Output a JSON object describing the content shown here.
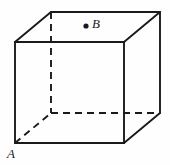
{
  "figure": {
    "type": "geometric-solid-diagram",
    "solid": "cube",
    "background_color": "#fefefe",
    "stroke_color": "#1a1a1a",
    "canvas": {
      "width": 170,
      "height": 165
    }
  },
  "labels": {
    "a": "A",
    "b": "B"
  },
  "points": {
    "b_dot": {
      "name": "point-B-marker",
      "x": 86,
      "y": 26,
      "radius": 2.6,
      "fill": "#1a1a1a"
    }
  },
  "geometry": {
    "front_face": {
      "name": "front-face",
      "top_left": [
        15,
        42
      ],
      "top_right": [
        124,
        42
      ],
      "bottom_right": [
        124,
        143
      ],
      "bottom_left": [
        15,
        143
      ]
    },
    "back_face": {
      "name": "back-face",
      "top_left": [
        51,
        12
      ],
      "top_right": [
        160,
        12
      ],
      "bottom_right": [
        160,
        113
      ],
      "bottom_left": [
        51,
        113
      ]
    },
    "solid_edges": [
      {
        "name": "front-top-edge",
        "from": [
          15,
          42
        ],
        "to": [
          124,
          42
        ]
      },
      {
        "name": "front-left-edge",
        "from": [
          15,
          42
        ],
        "to": [
          15,
          143
        ]
      },
      {
        "name": "front-bottom-edge",
        "from": [
          15,
          143
        ],
        "to": [
          124,
          143
        ]
      },
      {
        "name": "front-right-edge",
        "from": [
          124,
          42
        ],
        "to": [
          124,
          143
        ]
      },
      {
        "name": "back-top-edge",
        "from": [
          51,
          12
        ],
        "to": [
          160,
          12
        ]
      },
      {
        "name": "back-right-edge",
        "from": [
          160,
          12
        ],
        "to": [
          160,
          113
        ]
      },
      {
        "name": "top-left-diagonal-edge",
        "from": [
          15,
          42
        ],
        "to": [
          51,
          12
        ]
      },
      {
        "name": "top-right-diagonal-edge",
        "from": [
          124,
          42
        ],
        "to": [
          160,
          12
        ]
      },
      {
        "name": "bottom-right-diagonal-edge",
        "from": [
          124,
          143
        ],
        "to": [
          160,
          113
        ]
      }
    ],
    "hidden_edges": [
      {
        "name": "hidden-back-left-vertical-edge",
        "from": [
          51,
          12
        ],
        "to": [
          51,
          113
        ]
      },
      {
        "name": "hidden-back-bottom-edge",
        "from": [
          51,
          113
        ],
        "to": [
          160,
          113
        ]
      },
      {
        "name": "hidden-bottom-left-diagonal-edge",
        "from": [
          15,
          143
        ],
        "to": [
          51,
          113
        ]
      }
    ],
    "stroke_width": 1.9,
    "dash_pattern": "7,5"
  }
}
